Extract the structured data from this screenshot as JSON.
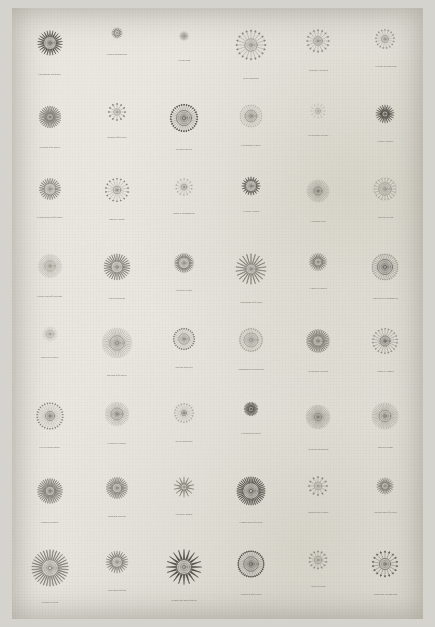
{
  "plate": {
    "medium": "scanned antique engraved plate",
    "paper_color": "#e9e7e0",
    "border_color": "#d4d3cd",
    "ink_color": "#7a776e",
    "ink_color_dark": "#4b4842",
    "columns": 6,
    "rows": 8,
    "specimen_count": 48
  },
  "specimens": [
    {
      "caption": "Cardamine pratensis",
      "rays": 26,
      "ray_type": "spike",
      "ray_len": 10,
      "core": 11,
      "tone": "dark",
      "size": 58
    },
    {
      "caption": "Nigella damascena",
      "rays": 16,
      "ray_type": "spike",
      "ray_len": 7,
      "core": 7,
      "tone": "mid",
      "size": 38
    },
    {
      "caption": "Allium cepa",
      "rays": 40,
      "ray_type": "tick",
      "ray_len": 4,
      "core": 5,
      "tone": "light",
      "size": 44
    },
    {
      "caption": "Bellis perennis",
      "rays": 20,
      "ray_type": "arrow",
      "ray_len": 14,
      "core": 10,
      "tone": "mid",
      "size": 62
    },
    {
      "caption": "Anthemis tinctoria",
      "rays": 16,
      "ray_type": "arrow",
      "ray_len": 13,
      "core": 8,
      "tone": "mid",
      "size": 54
    },
    {
      "caption": "Achillea millefolium",
      "rays": 17,
      "ray_type": "arrow",
      "ray_len": 12,
      "core": 7,
      "tone": "mid",
      "size": 50
    },
    {
      "caption": "Bryonia officinalis",
      "rays": 30,
      "ray_type": "blade",
      "ray_len": 13,
      "core": 6,
      "tone": "mid",
      "size": 56
    },
    {
      "caption": "Borago officinalis",
      "rays": 12,
      "ray_type": "club",
      "ray_len": 11,
      "core": 7,
      "tone": "mid",
      "size": 46
    },
    {
      "caption": "Bryonia dioica",
      "rays": 34,
      "ray_type": "club",
      "ray_len": 10,
      "core": 13,
      "tone": "dark",
      "size": 58
    },
    {
      "caption": "Centaurea cyanus",
      "rays": 28,
      "ray_type": "hook",
      "ray_len": 9,
      "core": 11,
      "tone": "mid",
      "size": 54
    },
    {
      "caption": "Cichorium intybus",
      "rays": 12,
      "ray_type": "hook",
      "ray_len": 10,
      "core": 6,
      "tone": "light",
      "size": 44
    },
    {
      "caption": "Crepis biennis",
      "rays": 22,
      "ray_type": "spike",
      "ray_len": 12,
      "core": 6,
      "tone": "dark",
      "size": 50
    },
    {
      "caption": "Cynoglossum officinale",
      "rays": 26,
      "ray_type": "blade",
      "ray_len": 9,
      "core": 11,
      "tone": "mid",
      "size": 52
    },
    {
      "caption": "Daucus carota",
      "rays": 18,
      "ray_type": "club",
      "ray_len": 14,
      "core": 7,
      "tone": "mid",
      "size": 54
    },
    {
      "caption": "Datura stramonium",
      "rays": 14,
      "ray_type": "loop",
      "ray_len": 11,
      "core": 6,
      "tone": "mid",
      "size": 48
    },
    {
      "caption": "Echium vulgare",
      "rays": 20,
      "ray_type": "spike",
      "ray_len": 8,
      "core": 12,
      "tone": "dark",
      "size": 46
    },
    {
      "caption": "Erigeron acris",
      "rays": 40,
      "ray_type": "tick",
      "ray_len": 12,
      "core": 7,
      "tone": "mid",
      "size": 56
    },
    {
      "caption": "Galium verum",
      "rays": 20,
      "ray_type": "fork",
      "ray_len": 9,
      "core": 12,
      "tone": "mid",
      "size": 52
    },
    {
      "caption": "Hieracium officinarum",
      "rays": 44,
      "ray_type": "tick",
      "ray_len": 11,
      "core": 9,
      "tone": "light",
      "size": 56
    },
    {
      "caption": "Inula helenium",
      "rays": 30,
      "ray_type": "blade",
      "ray_len": 12,
      "core": 10,
      "tone": "mid",
      "size": 58
    },
    {
      "caption": "Lactuca virosa",
      "rays": 30,
      "ray_type": "spike",
      "ray_len": 8,
      "core": 11,
      "tone": "mid",
      "size": 50
    },
    {
      "caption": "Leontodon officinale",
      "rays": 22,
      "ray_type": "blade",
      "ray_len": 16,
      "core": 8,
      "tone": "mid",
      "size": 62
    },
    {
      "caption": "Linaria vulgaris",
      "rays": 24,
      "ray_type": "spike",
      "ray_len": 10,
      "core": 8,
      "tone": "mid",
      "size": 48
    },
    {
      "caption": "Matricaria chamomilla",
      "rays": 36,
      "ray_type": "hook",
      "ray_len": 9,
      "core": 13,
      "tone": "dark",
      "size": 58
    },
    {
      "caption": "Malva sylvestris",
      "rays": 26,
      "ray_type": "tick",
      "ray_len": 7,
      "core": 9,
      "tone": "light",
      "size": 42
    },
    {
      "caption": "Melissa officinalis",
      "rays": 44,
      "ray_type": "tick",
      "ray_len": 12,
      "core": 12,
      "tone": "mid",
      "size": 60
    },
    {
      "caption": "Mentha piperita",
      "rays": 28,
      "ray_type": "club",
      "ray_len": 10,
      "core": 10,
      "tone": "mid",
      "size": 52
    },
    {
      "caption": "Onopordum acanthium",
      "rays": 30,
      "ray_type": "loop",
      "ray_len": 8,
      "core": 13,
      "tone": "mid",
      "size": 54
    },
    {
      "caption": "Origanum vulgare",
      "rays": 34,
      "ray_type": "blade",
      "ray_len": 11,
      "core": 9,
      "tone": "mid",
      "size": 56
    },
    {
      "caption": "Papaver rhoeas",
      "rays": 22,
      "ray_type": "loop",
      "ray_len": 13,
      "core": 9,
      "tone": "dark",
      "size": 56
    },
    {
      "caption": "Picris hieracioides",
      "rays": 30,
      "ray_type": "drop",
      "ray_len": 14,
      "core": 8,
      "tone": "mid",
      "size": 58
    },
    {
      "caption": "Prunella vulgaris",
      "rays": 40,
      "ray_type": "tick",
      "ray_len": 10,
      "core": 11,
      "tone": "mid",
      "size": 54
    },
    {
      "caption": "Salvia pratensis",
      "rays": 20,
      "ray_type": "loop",
      "ray_len": 13,
      "core": 5,
      "tone": "mid",
      "size": 52
    },
    {
      "caption": "Scabiosa arvensis",
      "rays": 26,
      "ray_type": "blade",
      "ray_len": 9,
      "core": 6,
      "tone": "dark",
      "size": 44
    },
    {
      "caption": "Silybum marianum",
      "rays": 48,
      "ray_type": "tick",
      "ray_len": 13,
      "core": 6,
      "tone": "mid",
      "size": 60
    },
    {
      "caption": "Sonchus asper",
      "rays": 44,
      "ray_type": "tick",
      "ray_len": 12,
      "core": 10,
      "tone": "mid",
      "size": 58
    },
    {
      "caption": "Sinapis arvensis",
      "rays": 34,
      "ray_type": "blade",
      "ray_len": 13,
      "core": 8,
      "tone": "mid",
      "size": 58
    },
    {
      "caption": "Solanum nigrum",
      "rays": 30,
      "ray_type": "blade",
      "ray_len": 11,
      "core": 9,
      "tone": "mid",
      "size": 52
    },
    {
      "caption": "Stellaria media",
      "rays": 14,
      "ray_type": "spike",
      "ray_len": 14,
      "core": 6,
      "tone": "mid",
      "size": 50
    },
    {
      "caption": "Symphytum officinale",
      "rays": 40,
      "ray_type": "blade",
      "ray_len": 10,
      "core": 14,
      "tone": "dark",
      "size": 58
    },
    {
      "caption": "Tanacetum vulgare",
      "rays": 12,
      "ray_type": "arrow",
      "ray_len": 12,
      "core": 8,
      "tone": "mid",
      "size": 48
    },
    {
      "caption": "Taraxacum officinale",
      "rays": 22,
      "ray_type": "spike",
      "ray_len": 10,
      "core": 7,
      "tone": "mid",
      "size": 48
    },
    {
      "caption": "Thlaspi arvense",
      "rays": 34,
      "ray_type": "blade",
      "ray_len": 15,
      "core": 13,
      "tone": "mid",
      "size": 64
    },
    {
      "caption": "Tussilago farfara",
      "rays": 24,
      "ray_type": "spike",
      "ray_len": 11,
      "core": 10,
      "tone": "mid",
      "size": 52
    },
    {
      "caption": "Verbascum densiflorum",
      "rays": 20,
      "ray_type": "spike",
      "ray_len": 16,
      "core": 12,
      "tone": "dark",
      "size": 62
    },
    {
      "caption": "Veronica officinalis",
      "rays": 38,
      "ray_type": "club",
      "ray_len": 10,
      "core": 13,
      "tone": "dark",
      "size": 56
    },
    {
      "caption": "Viola tricolor",
      "rays": 14,
      "ray_type": "arrow",
      "ray_len": 11,
      "core": 8,
      "tone": "mid",
      "size": 48
    },
    {
      "caption": "Xanthium strumarium",
      "rays": 18,
      "ray_type": "arrow",
      "ray_len": 13,
      "core": 10,
      "tone": "dark",
      "size": 56
    }
  ]
}
